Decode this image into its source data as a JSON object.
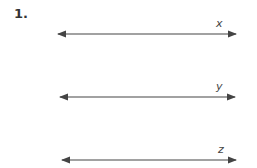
{
  "problem": {
    "number": "1."
  },
  "lines": [
    {
      "label": "x",
      "y": 34,
      "x1": 58,
      "x2": 236
    },
    {
      "label": "y",
      "y": 97,
      "x1": 60,
      "x2": 235
    },
    {
      "label": "z",
      "y": 160,
      "x1": 62,
      "x2": 236
    }
  ],
  "colors": {
    "line": "#444444"
  }
}
